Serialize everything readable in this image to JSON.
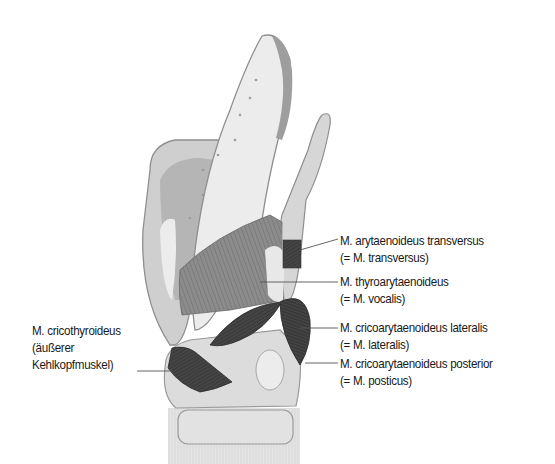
{
  "diagram": {
    "colors": {
      "background": "#ffffff",
      "cartilage_light": "#e6e6e6",
      "cartilage_mid": "#c8c8c8",
      "cartilage_dark": "#9a9a9a",
      "muscle_light": "#8a8a8a",
      "muscle_dark": "#3a3a3a",
      "leader_line": "#555555",
      "text": "#1a1a1a"
    },
    "labels": [
      {
        "id": "transversus",
        "line1": "M. arytaenoideus transversus",
        "line2": "(= M. transversus)"
      },
      {
        "id": "vocalis",
        "line1": "M. thyroarytaenoideus",
        "line2": "(= M. vocalis)"
      },
      {
        "id": "lateralis",
        "line1": "M. cricoarytaenoideus lateralis",
        "line2": "(= M. lateralis)"
      },
      {
        "id": "posterior",
        "line1": "M. cricoarytaenoideus posterior",
        "line2": "(= M. posticus)"
      },
      {
        "id": "cricothyroideus",
        "line1": "M. cricothyroideus",
        "line2": "(äußerer",
        "line3": "Kehlkopfmuskel)"
      }
    ]
  }
}
